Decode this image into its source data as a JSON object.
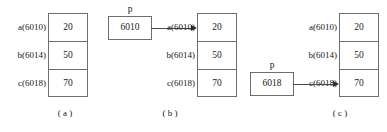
{
  "figure": {
    "values": [
      "20",
      "50",
      "70"
    ],
    "addresses": [
      "a(6010)",
      "b(6014)",
      "c(6018)"
    ],
    "pointer_name": "p"
  },
  "panels": [
    {
      "id": "a",
      "caption": "( a )",
      "addresses": [
        "a(6010)",
        "b(6014)",
        "c(6018)"
      ],
      "values": [
        "20",
        "50",
        "70"
      ],
      "pointer": null
    },
    {
      "id": "b",
      "caption": "( b )",
      "addresses": [
        "a(6010)",
        "b(6014)",
        "c(6018)"
      ],
      "values": [
        "20",
        "50",
        "70"
      ],
      "pointer": {
        "name": "p",
        "value": "6010",
        "target_index": 0,
        "target_address": "a(6010)"
      }
    },
    {
      "id": "c",
      "caption": "( c )",
      "addresses": [
        "a(6010)",
        "b(6014)",
        "c(6018)"
      ],
      "values": [
        "20",
        "50",
        "70"
      ],
      "pointer": {
        "name": "p",
        "value": "6018",
        "target_index": 2,
        "target_address": "c(6018)"
      }
    }
  ],
  "colors": {
    "border": "#6e6e6e",
    "arrow": "#2e2e2e",
    "text": "#1a1a1a",
    "background": "#ffffff"
  }
}
